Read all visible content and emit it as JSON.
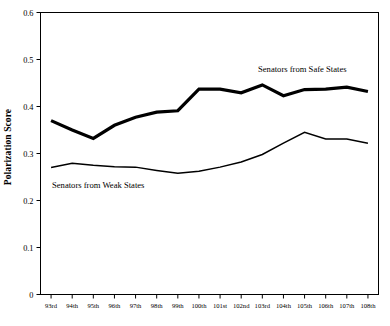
{
  "chart_data": {
    "type": "line",
    "title": "",
    "xlabel": "",
    "ylabel": "Polarization Score",
    "ylim": [
      0,
      0.6
    ],
    "ytick_labels": [
      "0",
      "0.1",
      "0.2",
      "0.3",
      "0.4",
      "0.5",
      "0.6"
    ],
    "ytick_values": [
      0,
      0.1,
      0.2,
      0.3,
      0.4,
      0.5,
      0.6
    ],
    "grid": false,
    "legend_position": "inline-annotations",
    "categories": [
      "93rd",
      "94th",
      "95th",
      "96th",
      "97th",
      "98th",
      "99th",
      "100th",
      "101st",
      "102nd",
      "103rd",
      "104th",
      "105th",
      "106th",
      "107th",
      "108th"
    ],
    "series": [
      {
        "name": "Senators from Safe States",
        "style": "thick",
        "annotation": "Senators from Safe States",
        "values": [
          0.37,
          0.35,
          0.332,
          0.36,
          0.377,
          0.388,
          0.391,
          0.437,
          0.437,
          0.429,
          0.446,
          0.423,
          0.436,
          0.437,
          0.441,
          0.432
        ]
      },
      {
        "name": "Senators from Weak States",
        "style": "thin",
        "annotation": "Senators from Weak States",
        "values": [
          0.27,
          0.279,
          0.275,
          0.272,
          0.271,
          0.264,
          0.258,
          0.262,
          0.271,
          0.282,
          0.298,
          0.322,
          0.345,
          0.331,
          0.331,
          0.322
        ]
      }
    ]
  },
  "annotations": {
    "safe_states": "Senators from Safe States",
    "weak_states": "Senators from Weak States"
  },
  "axis": {
    "y_title": "Polarization Score"
  }
}
